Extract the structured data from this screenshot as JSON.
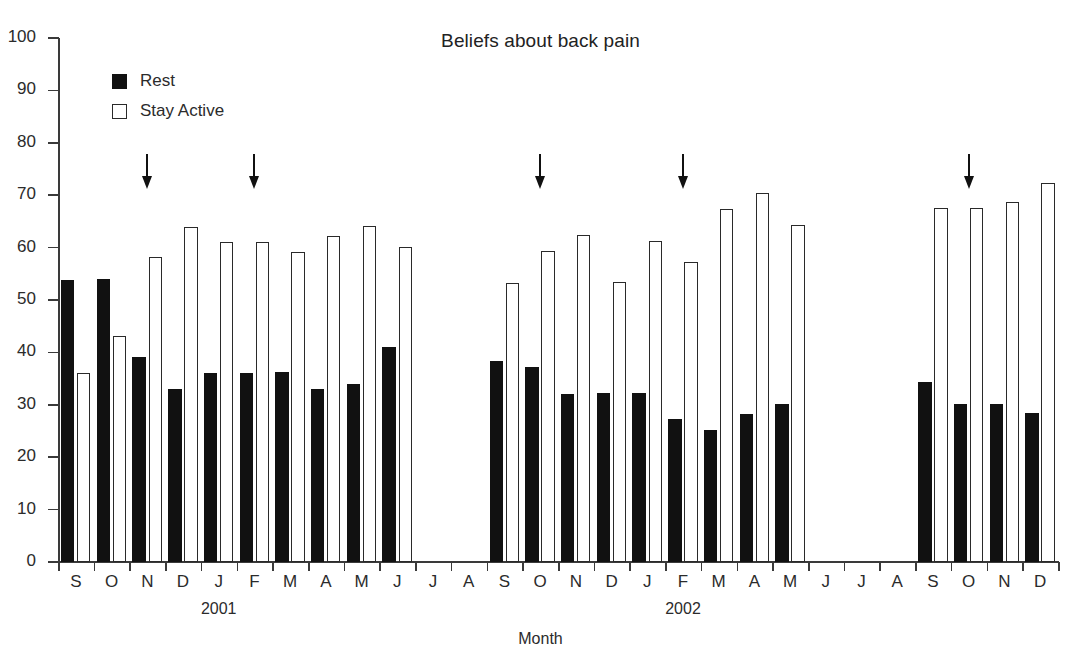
{
  "chart_data": {
    "type": "bar",
    "title": "Beliefs about back pain",
    "xlabel": "Month",
    "ylabel": "",
    "ylim": [
      0,
      100
    ],
    "ytick_step": 10,
    "yticks": [
      "0",
      "10",
      "20",
      "30",
      "40",
      "50",
      "60",
      "70",
      "80",
      "90",
      "100"
    ],
    "grid": false,
    "legend_position": "top-left",
    "legend": [
      "Rest",
      "Stay Active"
    ],
    "group_labels": [
      "2001",
      "2002"
    ],
    "categories": [
      "S",
      "O",
      "N",
      "D",
      "J",
      "F",
      "M",
      "A",
      "M",
      "J",
      "J",
      "A",
      "S",
      "O",
      "N",
      "D",
      "J",
      "F",
      "M",
      "A",
      "M",
      "J",
      "J",
      "A",
      "S",
      "O",
      "N",
      "D"
    ],
    "series": [
      {
        "name": "Rest",
        "color": "#111111",
        "values": [
          53.9,
          54.1,
          39.1,
          33.1,
          36.0,
          36.0,
          36.2,
          33.0,
          34.0,
          41.0,
          null,
          null,
          38.3,
          37.2,
          32.1,
          32.2,
          32.2,
          27.2,
          25.2,
          28.2,
          30.2,
          null,
          null,
          null,
          34.3,
          30.2,
          30.2,
          28.5
        ]
      },
      {
        "name": "Stay Active",
        "color": "#ffffff",
        "values": [
          36.0,
          43.1,
          58.2,
          63.9,
          61.0,
          61.0,
          59.1,
          62.3,
          64.1,
          60.2,
          null,
          null,
          53.2,
          59.3,
          62.4,
          53.4,
          61.3,
          57.3,
          67.3,
          70.5,
          64.4,
          null,
          null,
          null,
          67.5,
          67.5,
          68.7,
          72.3
        ]
      }
    ],
    "annotations": [
      {
        "type": "arrow",
        "category_index": 2,
        "label": "intervention-arrow-1"
      },
      {
        "type": "arrow",
        "category_index": 5,
        "label": "intervention-arrow-2"
      },
      {
        "type": "arrow",
        "category_index": 13,
        "label": "intervention-arrow-3"
      },
      {
        "type": "arrow",
        "category_index": 17,
        "label": "intervention-arrow-4"
      },
      {
        "type": "arrow",
        "category_index": 25,
        "label": "intervention-arrow-5"
      }
    ]
  }
}
